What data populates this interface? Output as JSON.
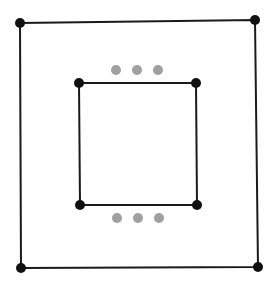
{
  "diagram": {
    "colors": {
      "line": "#1a1a1a",
      "vertex": "#111111",
      "ellipsis": "#a0a0a0",
      "background": "#ffffff"
    },
    "outer_square": {
      "vertices": [
        [
          20,
          23
        ],
        [
          255,
          20
        ],
        [
          258,
          267
        ],
        [
          21,
          268
        ]
      ]
    },
    "inner_square": {
      "vertices": [
        [
          79,
          83
        ],
        [
          196,
          83
        ],
        [
          197,
          205
        ],
        [
          80,
          205
        ]
      ]
    },
    "ellipsis_top": {
      "dots": [
        [
          116,
          70
        ],
        [
          137,
          70
        ],
        [
          158,
          70
        ]
      ]
    },
    "ellipsis_bottom": {
      "dots": [
        [
          117,
          218
        ],
        [
          138,
          218
        ],
        [
          159,
          218
        ]
      ]
    }
  }
}
